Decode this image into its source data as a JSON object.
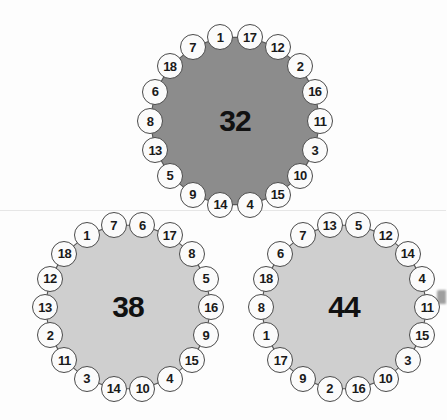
{
  "canvas": {
    "width": 446,
    "height": 420,
    "background": "#fdfdfd"
  },
  "colors": {
    "dark_fill": "#8c8c8c",
    "light_fill": "#cfcfcf",
    "polygon_stroke": "#5a5a5a",
    "node_fill": "#fbfbfb",
    "node_stroke": "#4a4a4a",
    "text": "#111111"
  },
  "figures": [
    {
      "id": "polygon-32",
      "center_value": "32",
      "fill": "#8c8c8c",
      "sides": 18,
      "cx": 235,
      "cy": 121,
      "radius": 85,
      "start_angle": -100,
      "node_labels": [
        "1",
        "17",
        "12",
        "2",
        "16",
        "11",
        "3",
        "10",
        "15",
        "4",
        "14",
        "9",
        "5",
        "13",
        "8",
        "6",
        "18",
        "7"
      ]
    },
    {
      "id": "polygon-38",
      "center_value": "38",
      "fill": "#cfcfcf",
      "sides": 18,
      "cx": 128,
      "cy": 307,
      "radius": 83,
      "start_angle": -100,
      "node_labels": [
        "7",
        "6",
        "17",
        "8",
        "5",
        "16",
        "9",
        "15",
        "4",
        "10",
        "14",
        "3",
        "11",
        "2",
        "13",
        "12",
        "18",
        "1"
      ]
    },
    {
      "id": "polygon-44",
      "center_value": "44",
      "fill": "#cfcfcf",
      "sides": 18,
      "cx": 344,
      "cy": 307,
      "radius": 83,
      "start_angle": -100,
      "node_labels": [
        "13",
        "5",
        "12",
        "14",
        "4",
        "11",
        "15",
        "3",
        "10",
        "16",
        "2",
        "9",
        "17",
        "1",
        "8",
        "18",
        "6",
        "7"
      ]
    }
  ],
  "artifacts": {
    "scan_line_y": 210,
    "scan_line_y2": 212
  }
}
